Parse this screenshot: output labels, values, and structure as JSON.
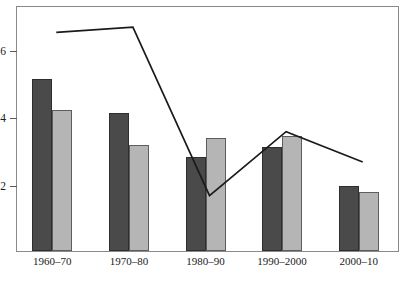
{
  "chart_data": {
    "type": "bar",
    "title": "",
    "subtitle": "",
    "xlabel": "",
    "ylabel": "",
    "categories": [
      "1960–70",
      "1970–80",
      "1980–90",
      "1990–2000",
      "2000–10"
    ],
    "ylim": [
      0,
      7.3
    ],
    "yticks": [
      2,
      4,
      6
    ],
    "ytick_labels": [
      "2",
      "4",
      "6"
    ],
    "grid": false,
    "legend_position": "top-center",
    "series": [
      {
        "name": "Mexico",
        "type": "line",
        "color": "#1a1a1a",
        "values": [
          6.55,
          6.7,
          1.7,
          3.6,
          2.7
        ]
      },
      {
        "name": "Canada",
        "type": "bar",
        "color": "#4a4a4a",
        "values": [
          5.1,
          4.1,
          2.8,
          3.1,
          1.92
        ]
      },
      {
        "name": "United States",
        "type": "bar",
        "color": "#b5b5b5",
        "values": [
          4.18,
          3.15,
          3.35,
          3.4,
          1.75
        ]
      }
    ]
  },
  "legend": {
    "items": [
      {
        "label": "Mexico",
        "marker": "line-marker",
        "color": "#1a1a1a"
      },
      {
        "label": "Canada",
        "marker": "square-marker",
        "color": "#4a4a4a"
      },
      {
        "label": "United States",
        "marker": "square-marker",
        "color": "#b5b5b5"
      }
    ]
  },
  "axes": {
    "y_tick_labels": [
      "2",
      "4",
      "6"
    ],
    "x_tick_labels": [
      "1960–70",
      "1970–80",
      "1980–90",
      "1990–2000",
      "2000–10"
    ]
  }
}
